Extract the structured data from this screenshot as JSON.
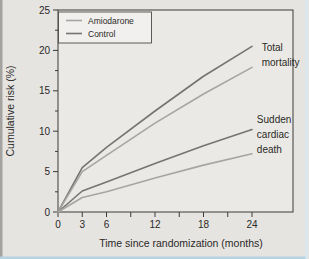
{
  "figure": {
    "background": "#e6e4e1",
    "plot_background": "#ebe9e6",
    "axis_color": "#3b3a38",
    "text_color": "#2a2927",
    "border_left_color": "#a5a3a0",
    "border_bottom_color": "#b5d3e2",
    "border_right_color": "#d8e6ef",
    "legend_background": "#f1f0ee"
  },
  "chart_data": {
    "type": "line",
    "title": "",
    "xlabel": "Time since randomization (months)",
    "ylabel": "Cumulative risk (%)",
    "x": [
      0,
      3,
      6,
      12,
      18,
      24
    ],
    "xlim": [
      0,
      29
    ],
    "ylim": [
      0,
      25
    ],
    "grid": false,
    "x_ticks_all": [
      0,
      3,
      6,
      9,
      12,
      15,
      18,
      21,
      24
    ],
    "x_tick_labels": [
      {
        "value": 0,
        "label": "0"
      },
      {
        "value": 3,
        "label": "3"
      },
      {
        "value": 6,
        "label": "6"
      },
      {
        "value": 12,
        "label": "12"
      },
      {
        "value": 18,
        "label": "18"
      },
      {
        "value": 24,
        "label": "24"
      }
    ],
    "y_ticks_major": [
      {
        "value": 0,
        "label": "0"
      },
      {
        "value": 5,
        "label": "5"
      },
      {
        "value": 10,
        "label": "10"
      },
      {
        "value": 15,
        "label": "15"
      },
      {
        "value": 20,
        "label": "20"
      },
      {
        "value": 25,
        "label": "25"
      }
    ],
    "y_ticks_minor": [
      2.5,
      7.5,
      12.5,
      17.5,
      22.5
    ],
    "legend": {
      "position": "top-left",
      "entries": [
        {
          "label": "Amiodarone",
          "color": "#a7a5a1"
        },
        {
          "label": "Control",
          "color": "#767471"
        }
      ]
    },
    "series": [
      {
        "id": "total-mortality-control",
        "name": "Total mortality — Control",
        "group": "Control",
        "color": "#767471",
        "values": [
          0,
          5.5,
          8.0,
          12.5,
          16.8,
          20.5
        ]
      },
      {
        "id": "total-mortality-amiodarone",
        "name": "Total mortality — Amiodarone",
        "group": "Amiodarone",
        "color": "#a7a5a1",
        "values": [
          0,
          5.0,
          7.0,
          11.0,
          14.6,
          17.9
        ]
      },
      {
        "id": "sudden-cardiac-death-control",
        "name": "Sudden cardiac death — Control",
        "group": "Control",
        "color": "#767471",
        "values": [
          0,
          2.6,
          3.7,
          6.0,
          8.2,
          10.2
        ]
      },
      {
        "id": "sudden-cardiac-death-amiodarone",
        "name": "Sudden cardiac death — Amiodarone",
        "group": "Amiodarone",
        "color": "#a7a5a1",
        "values": [
          0,
          1.8,
          2.5,
          4.2,
          5.8,
          7.2
        ]
      }
    ],
    "annotations": [
      {
        "id": "total-mortality-label",
        "lines": [
          "Total",
          "mortality"
        ],
        "x_months": 25.2,
        "y_value": 20.4
      },
      {
        "id": "sudden-cardiac-death-label",
        "lines": [
          "Sudden",
          "cardiac",
          "death"
        ],
        "x_months": 24.6,
        "y_value": 11.5
      }
    ]
  }
}
